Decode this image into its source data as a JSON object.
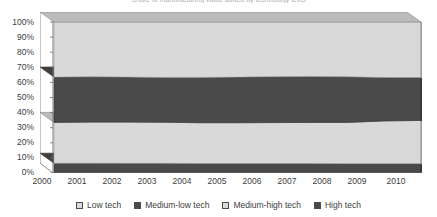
{
  "chart_data": {
    "type": "area",
    "title": "Share of manufacturing value added by technology level",
    "stacked": true,
    "normalized": true,
    "x": [
      2000,
      2001,
      2002,
      2003,
      2004,
      2005,
      2006,
      2007,
      2008,
      2009,
      2010
    ],
    "categories": [
      "2000",
      "2001",
      "2002",
      "2003",
      "2004",
      "2005",
      "2006",
      "2007",
      "2008",
      "2009",
      "2010"
    ],
    "series": [
      {
        "name": "High tech",
        "color": "#4a4a4a",
        "values": [
          6.5,
          6.5,
          6.4,
          6.4,
          6.3,
          6.3,
          6.3,
          6.3,
          6.2,
          6.2,
          6.2
        ]
      },
      {
        "name": "Medium-high tech",
        "color": "#d9d9d9",
        "values": [
          27.0,
          27.2,
          27.3,
          27.2,
          27.0,
          27.0,
          27.1,
          27.2,
          27.3,
          28.3,
          28.6
        ]
      },
      {
        "name": "Medium-low tech",
        "color": "#4a4a4a",
        "values": [
          30.0,
          30.0,
          29.8,
          29.7,
          30.0,
          30.2,
          30.4,
          30.4,
          30.2,
          28.7,
          28.4
        ]
      },
      {
        "name": "Low tech",
        "color": "#d9d9d9",
        "values": [
          36.5,
          36.3,
          36.5,
          36.7,
          36.7,
          36.5,
          36.2,
          36.1,
          36.3,
          36.8,
          36.8
        ]
      }
    ],
    "xlabel": "",
    "ylabel": "",
    "ylim": [
      0,
      100
    ],
    "ytick_labels": [
      "100%",
      "90%",
      "80%",
      "70%",
      "60%",
      "50%",
      "40%",
      "30%",
      "20%",
      "10%",
      "0%"
    ],
    "ytick_values": [
      100,
      90,
      80,
      70,
      60,
      50,
      40,
      30,
      20,
      10,
      0
    ],
    "grid": false,
    "legend_position": "bottom",
    "legend_order": [
      "Low tech",
      "Medium-low tech",
      "Medium-high tech",
      "High tech"
    ]
  },
  "legend": {
    "items": [
      {
        "label": "Low tech",
        "color": "#d9d9d9"
      },
      {
        "label": "Medium-low tech",
        "color": "#4a4a4a"
      },
      {
        "label": "Medium-high tech",
        "color": "#d9d9d9"
      },
      {
        "label": "High tech",
        "color": "#4a4a4a"
      }
    ]
  },
  "colors": {
    "light_band": "#d9d9d9",
    "dark_band": "#4a4a4a",
    "light_band_top": "#c2c2c2",
    "dark_band_top": "#3a3a3a",
    "light_band_side": "#b4b4b4",
    "dark_band_side": "#3d3d3d",
    "axis": "#6e6e6e",
    "text": "#3d3d3d"
  }
}
